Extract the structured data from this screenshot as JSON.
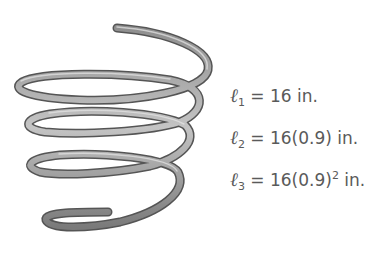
{
  "figure": {
    "equations": [
      {
        "symbol": "ℓ",
        "subscript": "1",
        "eq": " = ",
        "value": "16",
        "exponent": "",
        "unit": " in."
      },
      {
        "symbol": "ℓ",
        "subscript": "2",
        "eq": " = ",
        "value": "16(0.9)",
        "exponent": "",
        "unit": " in."
      },
      {
        "symbol": "ℓ",
        "subscript": "3",
        "eq": " = ",
        "value": "16(0.9)",
        "exponent": "2",
        "unit": " in."
      }
    ]
  }
}
